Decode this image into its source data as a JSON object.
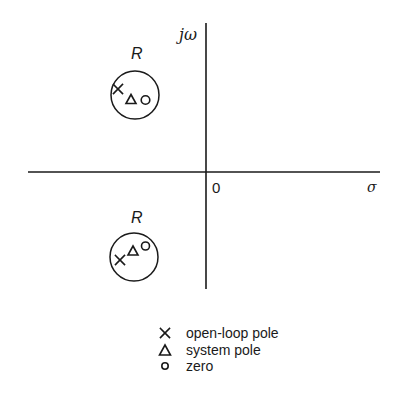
{
  "diagram": {
    "type": "s-plane pole-zero plot",
    "axes": {
      "imaginary_label": "jω",
      "real_label": "σ",
      "origin_label": "0"
    },
    "regions": [
      {
        "label": "R",
        "position": "upper-left half-plane",
        "contents": [
          "open-loop pole",
          "system pole",
          "zero"
        ]
      },
      {
        "label": "R",
        "position": "lower-left half-plane",
        "contents": [
          "open-loop pole",
          "system pole",
          "zero"
        ]
      }
    ],
    "legend": [
      {
        "symbol": "cross-icon",
        "label": "open-loop pole"
      },
      {
        "symbol": "triangle-icon",
        "label": "system pole"
      },
      {
        "symbol": "circle-icon",
        "label": "zero"
      }
    ],
    "colors": {
      "ink": "#1a1a1a",
      "background": "#ffffff"
    }
  }
}
